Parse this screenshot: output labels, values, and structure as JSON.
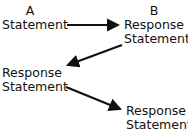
{
  "diagram": {
    "nodes": [
      {
        "id": "a",
        "lines": [
          "A",
          "Statement"
        ]
      },
      {
        "id": "b",
        "lines": [
          "B",
          "Response",
          "Statement"
        ]
      },
      {
        "id": "c",
        "lines": [
          "Response",
          "Statement"
        ]
      },
      {
        "id": "d",
        "lines": [
          "Response",
          "Statement"
        ]
      }
    ],
    "edges": [
      {
        "from": "a",
        "to": "b"
      },
      {
        "from": "b",
        "to": "c"
      },
      {
        "from": "c",
        "to": "d"
      }
    ],
    "colors": {
      "text": "#111111",
      "arrow": "#111111",
      "background": "#ffffff"
    }
  }
}
